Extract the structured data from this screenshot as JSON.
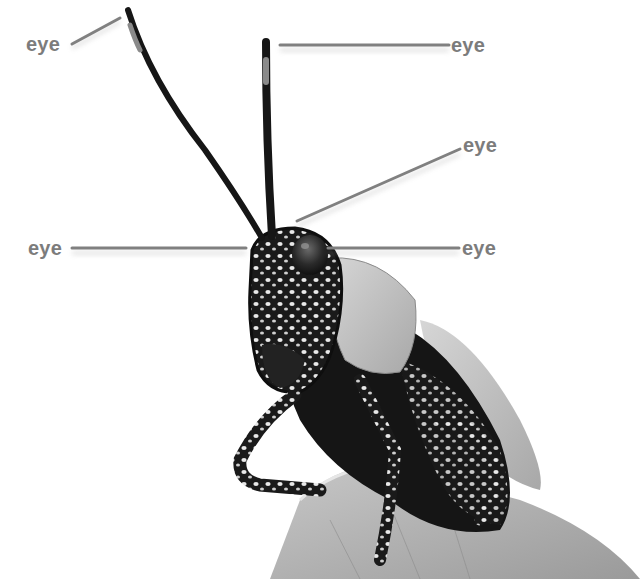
{
  "diagram": {
    "label_color": "#7c7c7c",
    "leader_color": "#808080",
    "labels": [
      {
        "id": "label-1",
        "text": "eye",
        "x": 26,
        "y": 34,
        "line": [
          72,
          44,
          120,
          18
        ]
      },
      {
        "id": "label-2",
        "text": "eye",
        "x": 451,
        "y": 35,
        "line": [
          280,
          45,
          449,
          45
        ]
      },
      {
        "id": "label-3",
        "text": "eye",
        "x": 463,
        "y": 135,
        "line": [
          297,
          221,
          460,
          149
        ]
      },
      {
        "id": "label-4",
        "text": "eye",
        "x": 28,
        "y": 238,
        "line": [
          72,
          248,
          246,
          248
        ]
      },
      {
        "id": "label-5",
        "text": "eye",
        "x": 462,
        "y": 238,
        "line": [
          328,
          248,
          459,
          248
        ]
      }
    ]
  }
}
